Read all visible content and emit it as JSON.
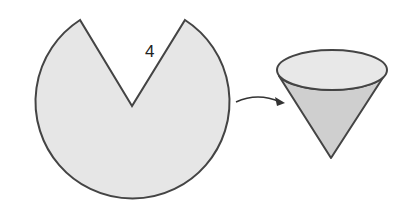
{
  "diagram": {
    "sector": {
      "label": "4",
      "fill": "#e6e6e6",
      "stroke": "#444444"
    },
    "arrow": {
      "direction": "sector-to-cone"
    },
    "cone": {
      "top_fill": "#e8e8e8",
      "body_fill": "#cfcfcf",
      "stroke": "#444444"
    }
  }
}
